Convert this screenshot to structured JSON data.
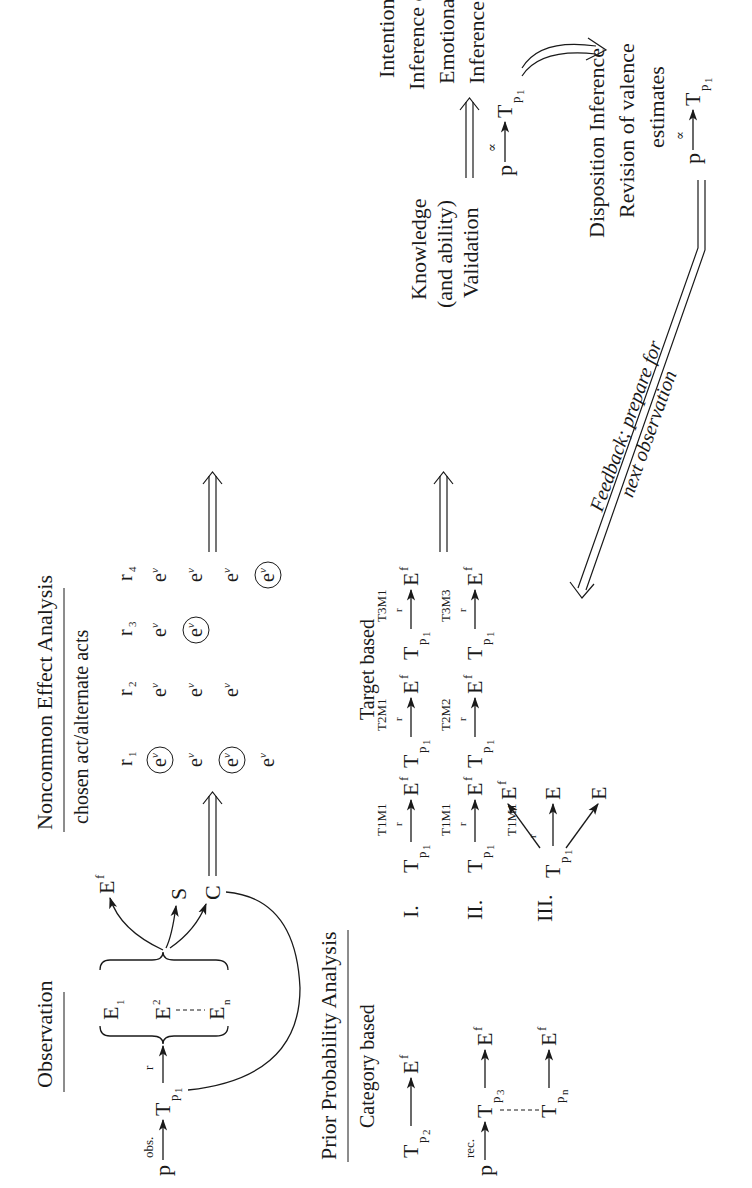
{
  "orientation": "rotated-90-ccw",
  "observation": {
    "title": "Observation",
    "p": "p",
    "obs_label": "obs.",
    "T": "T",
    "T_sub": "p",
    "T_subsub": "1",
    "r_label": "r",
    "effects": [
      "E",
      "E",
      "E"
    ],
    "effects_sub": [
      "1",
      "2",
      "n"
    ],
    "outputs": [
      {
        "label": "E",
        "sub": "f"
      },
      {
        "label": "S",
        "sub": ""
      },
      {
        "label": "C",
        "sub": ""
      }
    ]
  },
  "noncommon": {
    "title": "Noncommon Effect Analysis",
    "subtitle": "chosen act/alternate acts",
    "columns": [
      {
        "r": "r",
        "sub": "1",
        "cells": [
          "circled",
          "plain",
          "circled",
          "plain"
        ]
      },
      {
        "r": "r",
        "sub": "2",
        "cells": [
          "plain",
          "plain",
          "plain",
          ""
        ]
      },
      {
        "r": "r",
        "sub": "3",
        "cells": [
          "plain",
          "circled",
          "",
          ""
        ]
      },
      {
        "r": "r",
        "sub": "4",
        "cells": [
          "plain",
          "plain",
          "plain",
          "circled"
        ]
      }
    ],
    "cell_label": "e",
    "cell_sub": "v"
  },
  "prior": {
    "title": "Prior Probability Analysis",
    "category": {
      "title": "Category based",
      "p": "p",
      "rec_label": "rec.",
      "rows": [
        {
          "T": "T",
          "sub": "p",
          "subsub": "2",
          "E": "E",
          "Esub": "f"
        },
        {
          "T": "T",
          "sub": "p",
          "subsub": "3",
          "E": "E",
          "Esub": "f"
        },
        {
          "T": "T",
          "sub": "p",
          "subsub": "n",
          "E": "E",
          "Esub": "f"
        }
      ]
    },
    "target": {
      "title": "Target based",
      "rows": [
        {
          "numeral": "I.",
          "pairs": [
            {
              "label": "T1M1",
              "r": "r"
            },
            {
              "label": "T2M1",
              "r": "r"
            },
            {
              "label": "T3M1",
              "r": "r"
            }
          ]
        },
        {
          "numeral": "II.",
          "pairs": [
            {
              "label": "T1M1",
              "r": "r"
            },
            {
              "label": "T2M2",
              "r": "r"
            },
            {
              "label": "T3M3",
              "r": "r"
            }
          ]
        },
        {
          "numeral": "III.",
          "label": "T1M1",
          "r": "r",
          "targets": [
            "Ef",
            "E",
            "E"
          ]
        }
      ]
    }
  },
  "knowledge": {
    "lines": [
      "Knowledge",
      "(and ability)",
      "Validation"
    ]
  },
  "intention": {
    "lines": [
      "Intention",
      "Inference or",
      "Emotional",
      "Inference"
    ],
    "formula": {
      "p": "p",
      "symbol": "∝",
      "T": "T",
      "sub": "p",
      "subsub": "1"
    }
  },
  "disposition": {
    "lines": [
      "Disposition Inference",
      "Revision of valence",
      "estimates"
    ],
    "formula": {
      "p": "p",
      "symbol": "∝",
      "T": "T",
      "sub": "p",
      "subsub": "1"
    }
  },
  "feedback": {
    "lines": [
      "Feedback; prepare for",
      "next observation"
    ]
  }
}
